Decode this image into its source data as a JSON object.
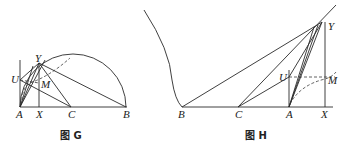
{
  "figures": [
    {
      "id": "G",
      "caption": "图 G",
      "points": {
        "A": {
          "label": "A",
          "x": 20,
          "y": 107
        },
        "X": {
          "label": "X",
          "x": 39,
          "y": 107
        },
        "C": {
          "label": "C",
          "x": 71,
          "y": 107
        },
        "B": {
          "label": "B",
          "x": 126,
          "y": 107
        },
        "Y": {
          "label": "Y",
          "x": 39,
          "y": 63
        },
        "U": {
          "label": "U",
          "x": 20,
          "y": 80
        },
        "M": {
          "label": "M",
          "x": 39,
          "y": 83
        }
      }
    },
    {
      "id": "H",
      "caption": "图 H",
      "points": {
        "B": {
          "label": "B",
          "x": 182,
          "y": 107
        },
        "C": {
          "label": "C",
          "x": 238,
          "y": 107
        },
        "A": {
          "label": "A",
          "x": 289,
          "y": 107
        },
        "X": {
          "label": "X",
          "x": 325,
          "y": 107
        },
        "Y": {
          "label": "Y",
          "x": 322,
          "y": 22
        },
        "U": {
          "label": "U",
          "x": 289,
          "y": 77
        },
        "M": {
          "label": "M",
          "x": 325,
          "y": 77
        }
      }
    }
  ]
}
